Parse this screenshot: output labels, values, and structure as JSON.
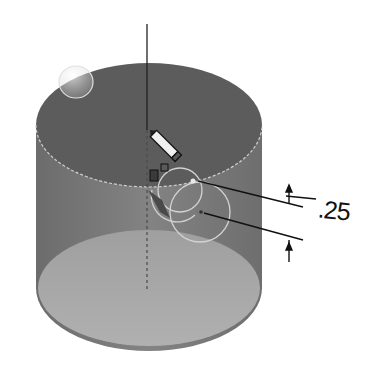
{
  "scene": {
    "description": "Isometric CAD view of a shaded cylinder with sketch annotations",
    "colors": {
      "background": "#ffffff",
      "top_face": "#5e5e5e",
      "side_face": "#7a7a7a",
      "bottom_inner": "#a8a8a8",
      "edge_highlight": "#d8d8d8",
      "dimension_line": "#111111"
    }
  },
  "annotations": {
    "dimension_value": ".25"
  },
  "icons": {
    "cursor": "pencil-icon",
    "relations": "sketch-relation-icons"
  }
}
